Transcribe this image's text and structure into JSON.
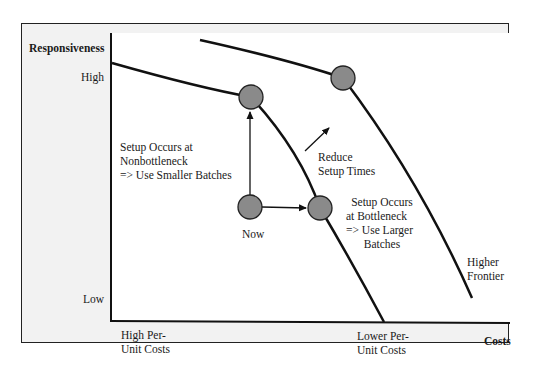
{
  "diagram": {
    "type": "tradeoff-frontier",
    "y_axis": {
      "title": "Responsiveness",
      "high_label": "High",
      "low_label": "Low"
    },
    "x_axis": {
      "title": "Costs",
      "left_label_line1": "High Per-",
      "left_label_line2": "Unit Costs",
      "right_label_line1": "Lower Per-",
      "right_label_line2": "Unit Costs"
    },
    "annotations": {
      "nonbottleneck": {
        "line1": "Setup Occurs at",
        "line2": "Nonbottleneck",
        "line3": "=> Use Smaller Batches"
      },
      "bottleneck": {
        "line1": "Setup Occurs",
        "line2": "at Bottleneck",
        "line3": "=> Use Larger",
        "line4": "Batches"
      },
      "reduce_setup": {
        "line1": "Reduce",
        "line2": "Setup Times"
      },
      "now": "Now",
      "higher_frontier": {
        "line1": "Higher",
        "line2": "Frontier"
      }
    },
    "nodes": [
      {
        "id": "now",
        "label": "Now"
      },
      {
        "id": "smaller-batches",
        "label": "Smaller batches point on current frontier"
      },
      {
        "id": "larger-batches",
        "label": "Larger batches point on current frontier"
      },
      {
        "id": "higher-frontier-point",
        "label": "Point on higher frontier"
      }
    ],
    "colors": {
      "node_fill": "#8a8a8a",
      "line": "#111111",
      "frame_fill": "#f2f2f2",
      "plot_fill": "#ffffff"
    }
  }
}
